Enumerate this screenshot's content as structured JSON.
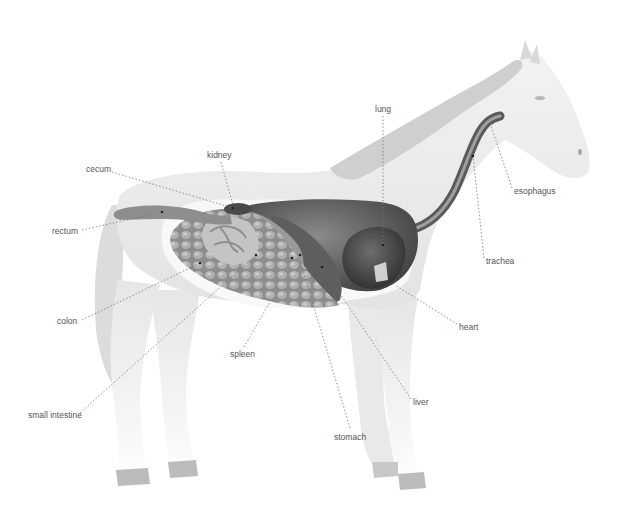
{
  "diagram": {
    "colors": {
      "background": "#ffffff",
      "body": "#ececec",
      "body_shade": "#d6d6d6",
      "organ_dark": "#4a4a4a",
      "organ_mid": "#7a7a7a",
      "organ_light": "#b5b5b5",
      "leader_line": "#777777",
      "label_text": "#555555"
    },
    "labels": [
      {
        "id": "cecum",
        "text": "cecum",
        "x": 86,
        "y": 164
      },
      {
        "id": "kidney",
        "text": "kidney",
        "x": 207,
        "y": 150
      },
      {
        "id": "lung",
        "text": "lung",
        "x": 375,
        "y": 104
      },
      {
        "id": "rectum",
        "text": "rectum",
        "x": 52,
        "y": 226
      },
      {
        "id": "esophagus",
        "text": "esophagus",
        "x": 514,
        "y": 186
      },
      {
        "id": "trachea",
        "text": "trachea",
        "x": 486,
        "y": 256
      },
      {
        "id": "colon",
        "text": "colon",
        "x": 57,
        "y": 316
      },
      {
        "id": "heart",
        "text": "heart",
        "x": 459,
        "y": 322
      },
      {
        "id": "spleen",
        "text": "spleen",
        "x": 230,
        "y": 349
      },
      {
        "id": "liver",
        "text": "liver",
        "x": 413,
        "y": 397
      },
      {
        "id": "small-intestine",
        "text": "small intestine",
        "x": 28,
        "y": 410
      },
      {
        "id": "stomach",
        "text": "stomach",
        "x": 334,
        "y": 432
      }
    ]
  }
}
